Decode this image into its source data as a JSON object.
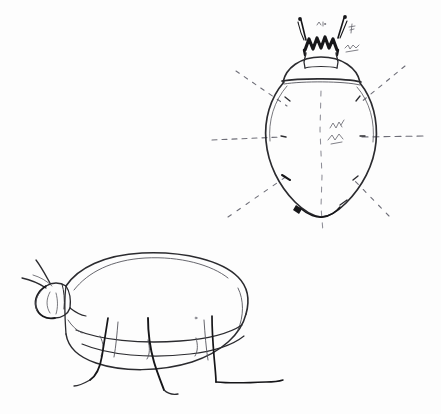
{
  "image": {
    "title": "Hand-drawn beetle study sketch",
    "medium": "pencil-on-paper",
    "background_color": "#fdfdfd",
    "ink_color": "#2b2b2f",
    "guide_color": "#6e6e78",
    "width": 441,
    "height": 414
  },
  "figures": [
    {
      "id": "dorsal-view",
      "label": "Dorsal view beetle with radiating leg guide lines",
      "position": "top-right",
      "parts": [
        "antenna-left",
        "antenna-right",
        "mandibles",
        "head",
        "pronotum",
        "elytra",
        "abdomen-tip"
      ],
      "guide_lines": [
        "horizontal-axis-left",
        "horizontal-axis-right",
        "diagonal-upper-left",
        "diagonal-upper-right",
        "diagonal-lower-left",
        "diagonal-lower-right",
        "vertical-midline"
      ],
      "annotations": [
        {
          "id": "note-head-left",
          "text": "",
          "note": "faint illegible pencil mark near left antenna"
        },
        {
          "id": "note-head-right",
          "text": "",
          "note": "faint illegible pencil mark near right antenna"
        },
        {
          "id": "note-pronotum",
          "text": "",
          "note": "faint illegible pencil scribble right of pronotum"
        },
        {
          "id": "note-elytra",
          "text": "",
          "note": "faint illegible pencil scribble on right elytron"
        }
      ]
    },
    {
      "id": "lateral-view",
      "label": "Lateral (side) view beetle",
      "position": "bottom-left",
      "parts": [
        "antenna-upper",
        "antenna-lower",
        "head",
        "pronotum",
        "elytra-dome",
        "underside",
        "leg-front",
        "leg-middle",
        "leg-rear",
        "ground-line"
      ],
      "annotations": []
    }
  ]
}
